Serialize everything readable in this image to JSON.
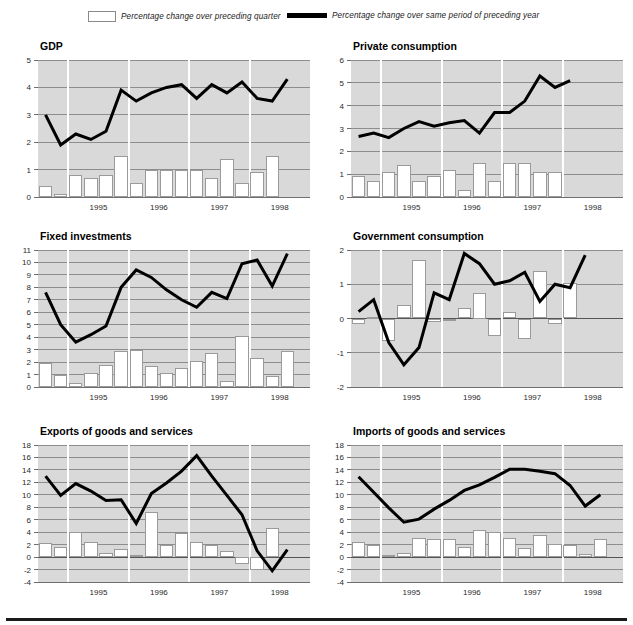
{
  "legend": {
    "bar_label": "Percentage change over preceding quarter",
    "line_label": "Percentage change over same period of preceding year",
    "bar_fill": "#ffffff",
    "bar_stroke": "#8a8a8a",
    "line_color": "#000000"
  },
  "style": {
    "plot_background": "#d9d9d9",
    "gridline_color": "#8d8d8d",
    "page_background": "#ffffff"
  },
  "x_axis": {
    "tick_labels": [
      "1995",
      "1996",
      "1997",
      "1998"
    ],
    "quarters": [
      "1994Q3",
      "1994Q4",
      "1995Q1",
      "1995Q2",
      "1995Q3",
      "1995Q4",
      "1996Q1",
      "1996Q2",
      "1996Q3",
      "1996Q4",
      "1997Q1",
      "1997Q2",
      "1997Q3",
      "1997Q4",
      "1998Q1",
      "1998Q2",
      "1998Q3",
      "1998Q4"
    ]
  },
  "chart_data": [
    {
      "type": "bar",
      "title": "GDP",
      "xlabel": "",
      "ylabel": "",
      "ylim": [
        0,
        5
      ],
      "yticks": [
        0,
        1,
        2,
        3,
        4,
        5
      ],
      "grid": true,
      "legend_position": "top",
      "categories": [
        "1994Q3",
        "1994Q4",
        "1995Q1",
        "1995Q2",
        "1995Q3",
        "1995Q4",
        "1996Q1",
        "1996Q2",
        "1996Q3",
        "1996Q4",
        "1997Q1",
        "1997Q2",
        "1997Q3",
        "1997Q4",
        "1998Q1",
        "1998Q2",
        "1998Q3",
        "1998Q4"
      ],
      "series": [
        {
          "name": "Percentage change over preceding quarter",
          "type": "bar",
          "values": [
            0.4,
            0.1,
            0.8,
            0.7,
            0.8,
            1.5,
            0.5,
            1.0,
            1.0,
            1.0,
            1.0,
            0.7,
            1.4,
            0.5,
            0.9,
            1.5,
            null,
            null
          ]
        },
        {
          "name": "Percentage change over same period of preceding year",
          "type": "line",
          "values": [
            3.0,
            1.9,
            2.3,
            2.1,
            2.4,
            3.9,
            3.5,
            3.8,
            4.0,
            4.1,
            3.6,
            4.1,
            3.8,
            4.2,
            3.6,
            3.5,
            4.3,
            null
          ]
        }
      ]
    },
    {
      "type": "bar",
      "title": "Private consumption",
      "xlabel": "",
      "ylabel": "",
      "ylim": [
        0,
        6
      ],
      "yticks": [
        0,
        1,
        2,
        3,
        4,
        5,
        6
      ],
      "grid": true,
      "legend_position": "top",
      "categories": [
        "1994Q3",
        "1994Q4",
        "1995Q1",
        "1995Q2",
        "1995Q3",
        "1995Q4",
        "1996Q1",
        "1996Q2",
        "1996Q3",
        "1996Q4",
        "1997Q1",
        "1997Q2",
        "1997Q3",
        "1997Q4",
        "1998Q1",
        "1998Q2",
        "1998Q3",
        "1998Q4"
      ],
      "series": [
        {
          "name": "Percentage change over preceding quarter",
          "type": "bar",
          "values": [
            0.9,
            0.7,
            1.1,
            1.4,
            0.7,
            0.9,
            1.2,
            0.3,
            1.5,
            0.7,
            1.5,
            1.5,
            1.1,
            1.1,
            null,
            null,
            null,
            null
          ]
        },
        {
          "name": "Percentage change over same period of preceding year",
          "type": "line",
          "values": [
            2.65,
            2.8,
            2.6,
            3.0,
            3.3,
            3.1,
            3.25,
            3.35,
            2.8,
            3.7,
            3.7,
            4.2,
            5.3,
            4.8,
            5.1,
            null,
            null,
            null
          ]
        }
      ]
    },
    {
      "type": "bar",
      "title": "Fixed investments",
      "xlabel": "",
      "ylabel": "",
      "ylim": [
        0,
        11
      ],
      "yticks": [
        0,
        1,
        2,
        3,
        4,
        5,
        6,
        7,
        8,
        9,
        10,
        11
      ],
      "grid": true,
      "legend_position": "top",
      "categories": [
        "1994Q3",
        "1994Q4",
        "1995Q1",
        "1995Q2",
        "1995Q3",
        "1995Q4",
        "1996Q1",
        "1996Q2",
        "1996Q3",
        "1996Q4",
        "1997Q1",
        "1997Q2",
        "1997Q3",
        "1997Q4",
        "1998Q1",
        "1998Q2",
        "1998Q3",
        "1998Q4"
      ],
      "series": [
        {
          "name": "Percentage change over preceding quarter",
          "type": "bar",
          "values": [
            1.9,
            1.0,
            0.35,
            1.1,
            1.8,
            2.9,
            3.0,
            1.7,
            1.1,
            1.5,
            2.1,
            2.7,
            0.5,
            4.1,
            2.3,
            0.9,
            2.9,
            null
          ]
        },
        {
          "name": "Percentage change over same period of preceding year",
          "type": "line",
          "values": [
            7.6,
            5.0,
            3.6,
            4.2,
            4.9,
            8.0,
            9.4,
            8.8,
            7.8,
            7.0,
            6.4,
            7.6,
            7.1,
            9.9,
            10.2,
            8.1,
            10.7,
            null
          ]
        }
      ]
    },
    {
      "type": "bar",
      "title": "Government consumption",
      "xlabel": "",
      "ylabel": "",
      "ylim": [
        -2,
        2
      ],
      "yticks": [
        -2,
        -1,
        0,
        1,
        2
      ],
      "grid": true,
      "legend_position": "top",
      "categories": [
        "1994Q3",
        "1994Q4",
        "1995Q1",
        "1995Q2",
        "1995Q3",
        "1995Q4",
        "1996Q1",
        "1996Q2",
        "1996Q3",
        "1996Q4",
        "1997Q1",
        "1997Q2",
        "1997Q3",
        "1997Q4",
        "1998Q1",
        "1998Q2",
        "1998Q3",
        "1998Q4"
      ],
      "series": [
        {
          "name": "Percentage change over preceding quarter",
          "type": "bar",
          "values": [
            -0.15,
            0.05,
            -0.65,
            0.4,
            1.7,
            -0.1,
            -0.08,
            0.3,
            0.75,
            -0.5,
            0.2,
            -0.6,
            1.4,
            -0.15,
            1.05,
            null,
            null,
            null
          ]
        },
        {
          "name": "Percentage change over same period of preceding year",
          "type": "line",
          "values": [
            0.2,
            0.55,
            -0.7,
            -1.35,
            -0.85,
            0.75,
            0.55,
            1.9,
            1.6,
            1.0,
            1.1,
            1.35,
            0.5,
            1.0,
            0.9,
            1.85,
            null,
            null
          ]
        }
      ]
    },
    {
      "type": "bar",
      "title": "Exports of goods and services",
      "xlabel": "",
      "ylabel": "",
      "ylim": [
        -4,
        18
      ],
      "yticks": [
        -4,
        -2,
        0,
        2,
        4,
        6,
        8,
        10,
        12,
        14,
        16,
        18
      ],
      "grid": true,
      "legend_position": "top",
      "categories": [
        "1994Q3",
        "1994Q4",
        "1995Q1",
        "1995Q2",
        "1995Q3",
        "1995Q4",
        "1996Q1",
        "1996Q2",
        "1996Q3",
        "1996Q4",
        "1997Q1",
        "1997Q2",
        "1997Q3",
        "1997Q4",
        "1998Q1",
        "1998Q2",
        "1998Q3",
        "1998Q4"
      ],
      "series": [
        {
          "name": "Percentage change over preceding quarter",
          "type": "bar",
          "values": [
            2.3,
            1.7,
            4.1,
            2.4,
            0.7,
            1.3,
            0.4,
            7.2,
            2.0,
            3.8,
            2.4,
            2.0,
            1.0,
            -1.1,
            -2.1,
            4.6,
            null,
            null
          ]
        },
        {
          "name": "Percentage change over same period of preceding year",
          "type": "line",
          "values": [
            13.0,
            9.9,
            11.8,
            10.6,
            9.1,
            9.2,
            5.4,
            10.2,
            11.9,
            13.8,
            16.3,
            13.0,
            9.9,
            6.8,
            1.0,
            -2.2,
            1.2,
            null
          ]
        }
      ]
    },
    {
      "type": "bar",
      "title": "Imports of goods and services",
      "xlabel": "",
      "ylabel": "",
      "ylim": [
        -4,
        18
      ],
      "yticks": [
        -4,
        -2,
        0,
        2,
        4,
        6,
        8,
        10,
        12,
        14,
        16,
        18
      ],
      "grid": true,
      "legend_position": "top",
      "categories": [
        "1994Q3",
        "1994Q4",
        "1995Q1",
        "1995Q2",
        "1995Q3",
        "1995Q4",
        "1996Q1",
        "1996Q2",
        "1996Q3",
        "1996Q4",
        "1997Q1",
        "1997Q2",
        "1997Q3",
        "1997Q4",
        "1998Q1",
        "1998Q2",
        "1998Q3",
        "1998Q4"
      ],
      "series": [
        {
          "name": "Percentage change over preceding quarter",
          "type": "bar",
          "values": [
            2.4,
            1.9,
            0.35,
            0.7,
            3.0,
            2.9,
            2.9,
            1.7,
            4.35,
            4.1,
            3.0,
            1.4,
            3.55,
            2.1,
            2.0,
            0.45,
            2.9,
            null
          ]
        },
        {
          "name": "Percentage change over same period of preceding year",
          "type": "line",
          "values": [
            12.9,
            10.4,
            7.9,
            5.6,
            6.1,
            7.7,
            9.1,
            10.7,
            11.6,
            12.8,
            14.1,
            14.1,
            13.8,
            13.4,
            11.5,
            8.2,
            10.0,
            null
          ]
        }
      ]
    }
  ]
}
